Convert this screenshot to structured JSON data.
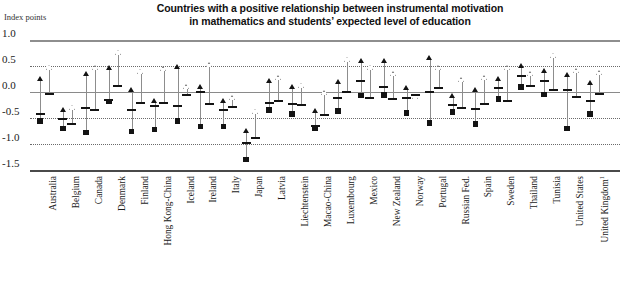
{
  "header": {
    "title_line1": "Countries with a positive relationship between instrumental motivation",
    "title_line2": "in mathematics and students’ expected level of education"
  },
  "axis": {
    "unit_label": "Index points",
    "y_ticks": [
      "1.0",
      "0.5",
      "0.0",
      "-0.5",
      "-1.0",
      "-1.5"
    ]
  },
  "chart_data": {
    "type": "scatter",
    "title": "Countries with a positive relationship between instrumental motivation in mathematics and students’ expected level of education",
    "xlabel": "",
    "ylabel": "Index points",
    "ylim": [
      -1.5,
      1.0
    ],
    "ytick_values": [
      1.0,
      0.5,
      0.0,
      -0.5,
      -1.0,
      -1.5
    ],
    "grid": true,
    "legend_position": "none",
    "marker_note": "Each country shows two ranges: a filled-square series and an open-square series. Each range has an upper triangle (upper bound), a mid dash (point estimate) and a lower square (lower bound).",
    "categories": [
      "Australia",
      "Belgium",
      "Canada",
      "Denmark",
      "Finland",
      "Hong Kong-China",
      "Iceland",
      "Ireland",
      "Italy",
      "Japan",
      "Latvia",
      "Liechtenstein",
      "Macao-China",
      "Luxembourg",
      "Mexico",
      "New Zealand",
      "Norway",
      "Portugal",
      "Russian Fed.",
      "Spain",
      "Sweden",
      "Thailand",
      "Tunisia",
      "United States",
      "United Kingdom"
    ],
    "category_footnote_index": 24,
    "category_footnote_marker": "1",
    "series": [
      {
        "name": "filled-square series",
        "marker": "filled-square",
        "upper": [
          0.22,
          -0.38,
          0.3,
          0.42,
          0.0,
          -0.22,
          0.45,
          0.06,
          -0.22,
          -0.78,
          0.17,
          0.05,
          -0.4,
          0.15,
          0.56,
          0.55,
          0.04,
          0.62,
          -0.11,
          0.0,
          0.22,
          0.46,
          0.36,
          0.28,
          0.14
        ],
        "estimate": [
          -0.42,
          -0.52,
          -0.3,
          -0.16,
          -0.34,
          -0.27,
          -0.26,
          0.0,
          -0.35,
          -0.98,
          -0.22,
          -0.23,
          -0.65,
          -0.12,
          0.22,
          0.1,
          -0.12,
          0.0,
          -0.25,
          -0.32,
          0.08,
          0.3,
          0.22,
          0.03,
          -0.18
        ],
        "lower": [
          -0.56,
          -0.7,
          -0.78,
          -0.18,
          -0.76,
          -0.72,
          -0.56,
          -0.66,
          -0.66,
          -1.3,
          -0.35,
          -0.42,
          -0.7,
          -0.37,
          -0.07,
          -0.06,
          -0.4,
          -0.6,
          -0.38,
          -0.62,
          -0.13,
          0.1,
          -0.05,
          -0.7,
          -0.42
        ]
      },
      {
        "name": "open-square series",
        "marker": "open-square",
        "upper": [
          0.43,
          -0.34,
          0.42,
          0.72,
          0.35,
          0.4,
          0.05,
          0.48,
          -0.16,
          -0.42,
          0.23,
          0.08,
          -0.06,
          0.58,
          0.43,
          0.3,
          -0.14,
          0.42,
          0.19,
          0.23,
          0.42,
          0.3,
          0.66,
          0.36,
          0.32
        ],
        "estimate": [
          -0.03,
          -0.62,
          -0.34,
          0.12,
          -0.21,
          -0.22,
          -0.05,
          -0.23,
          -0.28,
          -0.88,
          -0.18,
          -0.25,
          -0.45,
          0.0,
          -0.11,
          -0.13,
          -0.05,
          0.08,
          -0.3,
          -0.23,
          -0.17,
          0.12,
          0.04,
          -0.1,
          -0.04
        ]
      }
    ]
  }
}
